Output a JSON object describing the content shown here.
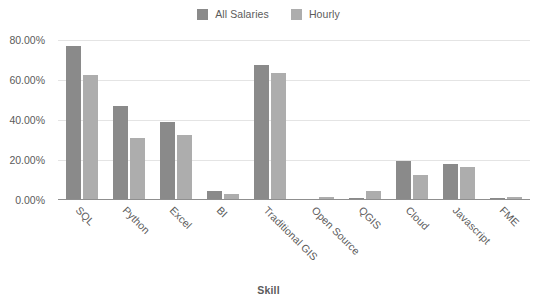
{
  "chart_data": {
    "type": "bar",
    "title": "",
    "xlabel": "Skill",
    "ylabel": "",
    "categories": [
      "SQL",
      "Python",
      "Excel",
      "BI",
      "Traditional GIS",
      "Open Source",
      "QGIS",
      "Cloud",
      "Javascript",
      "FME"
    ],
    "series": [
      {
        "name": "All Salaries",
        "color": "#8a8a8a",
        "values": [
          77.0,
          47.0,
          39.0,
          4.5,
          67.5,
          0.0,
          1.0,
          19.5,
          18.0,
          1.2
        ]
      },
      {
        "name": "Hourly",
        "color": "#adadad",
        "values": [
          62.5,
          31.0,
          32.5,
          3.0,
          63.5,
          1.5,
          4.5,
          12.5,
          16.5,
          1.3
        ]
      }
    ],
    "ylim": [
      0,
      80
    ],
    "yticks": [
      0,
      20,
      40,
      60,
      80
    ],
    "ytick_labels": [
      "0.00%",
      "20.00%",
      "40.00%",
      "60.00%",
      "80.00%"
    ],
    "grid": true,
    "legend_position": "top-center"
  },
  "legend": {
    "items": [
      {
        "label": "All Salaries",
        "color": "#8a8a8a"
      },
      {
        "label": "Hourly",
        "color": "#adadad"
      }
    ]
  },
  "axis": {
    "x_title": "Skill"
  }
}
